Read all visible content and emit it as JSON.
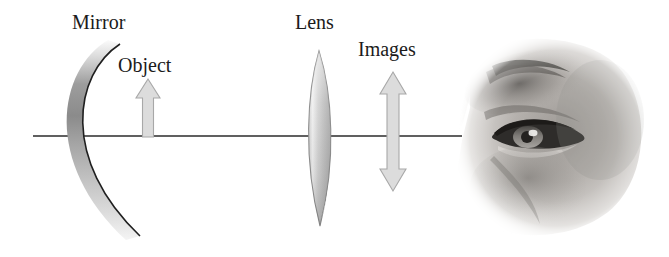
{
  "figure": {
    "width": 669,
    "height": 257,
    "background_color": "#ffffff"
  },
  "labels": {
    "mirror": "Mirror",
    "object": "Object",
    "lens": "Lens",
    "images": "Images"
  },
  "colors": {
    "axis_line": "#2b2b2b",
    "mirror_outline": "#1f1f1f",
    "mirror_fill_light": "#f2f2f2",
    "mirror_fill_dark": "#8f8f8f",
    "lens_outline": "#8a8a8a",
    "lens_fill_light": "#fdfdfd",
    "lens_fill_mid": "#c9c9c9",
    "lens_fill_dark": "#9a9a9a",
    "lens_highlight": "#ffffff",
    "arrow_fill": "#dcdcdc",
    "arrow_outline": "#a8a8a8",
    "text": "#1b1b1b",
    "eye_skin_light": "#e8e6e3",
    "eye_skin_mid": "#b9b6b2",
    "eye_skin_dark": "#6e6b68",
    "eye_lash_dark": "#2a2826"
  },
  "elements": {
    "optical_axis": {
      "name": "optical-axis",
      "y": 136,
      "x_start": 33,
      "x_end": 462
    },
    "mirror": {
      "name": "concave-mirror",
      "shape": "concave-arc",
      "opens": "right",
      "top_point": [
        120,
        44
      ],
      "bottom_point": [
        140,
        236
      ],
      "vertex_x": 64
    },
    "object_arrow": {
      "name": "object-arrow",
      "direction": "up",
      "x": 148,
      "tip_y": 79,
      "base_y": 137
    },
    "lens": {
      "name": "converging-lens",
      "shape": "biconvex",
      "center_x": 319,
      "top_y": 51,
      "bottom_y": 226,
      "max_half_width": 17
    },
    "images_arrow": {
      "name": "images-double-arrow",
      "direction": "double-vertical",
      "x": 393,
      "top_tip_y": 72,
      "bottom_tip_y": 191
    },
    "eye": {
      "name": "human-eye-photo",
      "description": "grayscale photograph of a human eye in profile facing left",
      "bounds": [
        455,
        35,
        200,
        205
      ]
    }
  }
}
